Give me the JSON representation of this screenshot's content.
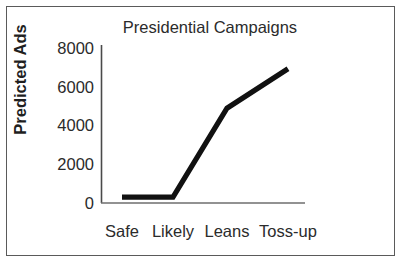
{
  "chart_data": {
    "type": "line",
    "title": "Presidential Campaigns",
    "xlabel": "",
    "ylabel": "Predicted Ads",
    "categories": [
      "Safe",
      "Likely",
      "Leans",
      "Toss-up"
    ],
    "values": [
      300,
      300,
      4800,
      6800
    ],
    "series": [
      {
        "name": "Predicted Ads",
        "values": [
          300,
          300,
          4800,
          6800
        ]
      }
    ],
    "ylim": [
      0,
      8000
    ],
    "yticks": [
      0,
      2000,
      4000,
      6000,
      8000
    ],
    "ytick_labels": [
      "0",
      "2000",
      "4000",
      "6000",
      "8000"
    ],
    "grid": false,
    "legend": null,
    "line_color": "#111111",
    "background_color": "#ffffff",
    "border_color": "#5a5a5a"
  }
}
